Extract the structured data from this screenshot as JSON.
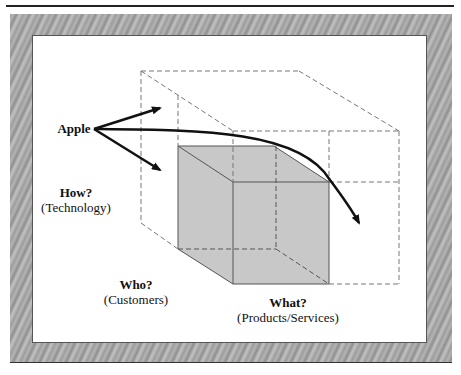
{
  "labels": {
    "apple": "Apple",
    "how": {
      "title": "How?",
      "subtitle": "(Technology)"
    },
    "who": {
      "title": "Who?",
      "subtitle": "(Customers)"
    },
    "what": {
      "title": "What?",
      "subtitle": "(Products/Services)"
    }
  },
  "colors": {
    "frame": "#a8a8a8",
    "cube_fill": "#c8c8c8",
    "dashed": "#777777",
    "arrow": "#111111"
  }
}
